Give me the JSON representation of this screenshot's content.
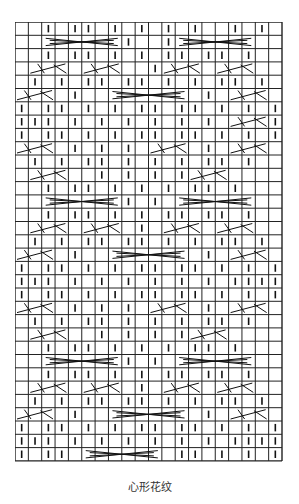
{
  "caption": "心形花纹",
  "grid": {
    "cols": 20,
    "rows": 33,
    "cell_w": 13.35,
    "cell_h": 13.3,
    "line_color": "#222222",
    "symbol_legend": {
      "|": "purl-mark",
      "": "blank",
      "C": "cable-cross"
    },
    "cells": [
      [
        "",
        "",
        "|",
        "",
        "|",
        "|",
        "",
        "|",
        "",
        "|",
        "",
        "|",
        "",
        "|",
        "",
        "",
        "|",
        "",
        "|",
        ""
      ],
      [
        "",
        "",
        "C",
        "C",
        "C",
        "C",
        "C",
        "C",
        "|",
        "",
        "",
        "|",
        "C",
        "C",
        "C",
        "C",
        "C",
        "C",
        "",
        ""
      ],
      [
        "",
        "",
        "|",
        "",
        "|",
        "|",
        "",
        "|",
        "",
        "|",
        "",
        "|",
        "|",
        "",
        "|",
        "|",
        "",
        "|",
        "",
        ""
      ],
      [
        "",
        "C",
        "C",
        "C",
        "",
        "C",
        "C",
        "C",
        "",
        "",
        "|",
        "C",
        "C",
        "C",
        "",
        "C",
        "C",
        "C",
        "",
        ""
      ],
      [
        "",
        "|",
        "",
        "|",
        "",
        "|",
        "|",
        "",
        "|",
        "|",
        "",
        "|",
        "",
        "|",
        "",
        "|",
        "|",
        "",
        "|",
        ""
      ],
      [
        "C",
        "C",
        "C",
        "",
        "|",
        "",
        "",
        "C",
        "C",
        "C",
        "C",
        "C",
        "C",
        "",
        "|",
        "",
        "C",
        "C",
        "C",
        ""
      ],
      [
        "|",
        "",
        "|",
        "|",
        "",
        "|",
        "",
        "|",
        "",
        "|",
        "|",
        "",
        "|",
        "|",
        "",
        "|",
        "",
        "|",
        "",
        "|"
      ],
      [
        "|",
        "|",
        "|",
        "",
        "|",
        "",
        "|",
        "",
        "|",
        "",
        "|",
        "",
        "|",
        "",
        "|",
        "",
        "C",
        "C",
        "C",
        "|"
      ],
      [
        "|",
        "",
        "|",
        "|",
        "",
        "|",
        "",
        "|",
        "",
        "|",
        "|",
        "",
        "|",
        "|",
        "",
        "|",
        "",
        "|",
        "",
        "|"
      ],
      [
        "C",
        "C",
        "C",
        "",
        "|",
        "",
        "|",
        "",
        "|",
        "",
        "C",
        "C",
        "C",
        "",
        "|",
        "",
        "C",
        "C",
        "C",
        ""
      ],
      [
        "",
        "|",
        "",
        "|",
        "",
        "|",
        "|",
        "",
        "|",
        "",
        "|",
        "",
        "|",
        "",
        "|",
        "|",
        "",
        "|",
        "",
        ""
      ],
      [
        "",
        "C",
        "C",
        "C",
        "",
        "",
        "|",
        "",
        "|",
        "",
        "|",
        "",
        "|",
        "C",
        "C",
        "C",
        "",
        "",
        "",
        ""
      ],
      [
        "",
        "",
        "|",
        "",
        "|",
        "|",
        "",
        "|",
        "",
        "|",
        "",
        "|",
        "",
        "|",
        "|",
        "",
        "|",
        "",
        ""
      ],
      [
        "",
        "",
        "C",
        "C",
        "C",
        "C",
        "C",
        "C",
        "|",
        "",
        "|",
        "",
        "C",
        "C",
        "C",
        "C",
        "C",
        "C",
        "",
        ""
      ],
      [
        "",
        "",
        "|",
        "",
        "|",
        "|",
        "",
        "|",
        "",
        "|",
        "",
        "|",
        "|",
        "",
        "|",
        "|",
        "",
        "|",
        "",
        ""
      ],
      [
        "",
        "C",
        "C",
        "C",
        "",
        "C",
        "C",
        "C",
        "",
        "|",
        "",
        "C",
        "C",
        "C",
        "",
        "C",
        "C",
        "C",
        "",
        ""
      ],
      [
        "",
        "|",
        "",
        "|",
        "",
        "|",
        "|",
        "",
        "|",
        "|",
        "",
        "|",
        "",
        "|",
        "",
        "|",
        "|",
        "",
        "|",
        ""
      ],
      [
        "C",
        "C",
        "C",
        "",
        "|",
        "",
        "",
        "C",
        "C",
        "C",
        "C",
        "C",
        "C",
        "",
        "|",
        "",
        "C",
        "C",
        "C",
        ""
      ],
      [
        "|",
        "",
        "|",
        "|",
        "",
        "|",
        "",
        "|",
        "",
        "|",
        "|",
        "",
        "|",
        "|",
        "",
        "|",
        "",
        "|",
        "",
        "|"
      ],
      [
        "|",
        "|",
        "|",
        "",
        "|",
        "",
        "|",
        "",
        "|",
        "",
        "|",
        "",
        "|",
        "",
        "|",
        "",
        "|",
        "|",
        "|",
        "|"
      ],
      [
        "|",
        "",
        "|",
        "|",
        "",
        "|",
        "",
        "|",
        "",
        "|",
        "|",
        "",
        "|",
        "|",
        "",
        "|",
        "",
        "|",
        "",
        "|"
      ],
      [
        "C",
        "C",
        "C",
        "",
        "|",
        "",
        "|",
        "",
        "|",
        "",
        "C",
        "C",
        "C",
        "",
        "|",
        "",
        "C",
        "C",
        "C",
        ""
      ],
      [
        "",
        "|",
        "",
        "|",
        "",
        "|",
        "|",
        "",
        "|",
        "",
        "|",
        "",
        "|",
        "",
        "|",
        "|",
        "",
        "|",
        "",
        ""
      ],
      [
        "",
        "C",
        "C",
        "C",
        "",
        "",
        "|",
        "",
        "|",
        "",
        "|",
        "",
        "|",
        "C",
        "C",
        "C",
        "",
        "",
        "",
        ""
      ],
      [
        "",
        "",
        "|",
        "",
        "|",
        "|",
        "",
        "|",
        "",
        "|",
        "",
        "|",
        "",
        "|",
        "|",
        "",
        "|",
        "",
        ""
      ],
      [
        "",
        "",
        "C",
        "C",
        "C",
        "C",
        "C",
        "C",
        "|",
        "",
        "|",
        "",
        "C",
        "C",
        "C",
        "C",
        "C",
        "C",
        "",
        ""
      ],
      [
        "",
        "",
        "|",
        "",
        "|",
        "|",
        "",
        "|",
        "",
        "|",
        "",
        "|",
        "|",
        "",
        "|",
        "|",
        "",
        "|",
        "",
        ""
      ],
      [
        "",
        "C",
        "C",
        "C",
        "",
        "C",
        "C",
        "C",
        "",
        "|",
        "",
        "C",
        "C",
        "C",
        "",
        "C",
        "C",
        "C",
        "",
        ""
      ],
      [
        "",
        "|",
        "",
        "|",
        "",
        "|",
        "|",
        "",
        "|",
        "|",
        "",
        "|",
        "",
        "|",
        "",
        "|",
        "|",
        "",
        "|",
        ""
      ],
      [
        "C",
        "C",
        "C",
        "",
        "|",
        "",
        "",
        "C",
        "C",
        "C",
        "C",
        "C",
        "C",
        "",
        "|",
        "",
        "C",
        "C",
        "C",
        ""
      ],
      [
        "|",
        "",
        "|",
        "|",
        "",
        "|",
        "",
        "|",
        "",
        "|",
        "|",
        "",
        "|",
        "|",
        "",
        "|",
        "",
        "|",
        "",
        "|"
      ],
      [
        "|",
        "|",
        "|",
        "",
        "|",
        "",
        "|",
        "",
        "|",
        "",
        "|",
        "",
        "|",
        "",
        "|",
        "",
        "|",
        "|",
        "|",
        "|"
      ],
      [
        "|",
        "",
        "|",
        "|",
        "",
        "C",
        "C",
        "C",
        "C",
        "C",
        "C",
        "",
        "|",
        "|",
        "",
        "|",
        "",
        "|",
        "",
        "|"
      ]
    ]
  }
}
